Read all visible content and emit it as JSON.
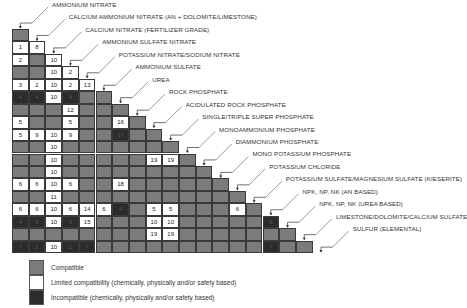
{
  "chart_data": {
    "type": "heatmap",
    "items": [
      "AMMONIUM NITRATE",
      "CALCIUM AMMONIUM NITRATE (AN + DOLOMITE/LIMESTONE)",
      "CALCIUM NITRATE (FERTILIZER GRADE)",
      "AMMONIUM SULFATE NITRATE",
      "POTASSIUM NITRATE/SODIUM NITRATE",
      "AMMONIUM SULFATE",
      "UREA",
      "ROCK PHOSPHATE",
      "ACIDULATED ROCK PHOSPHATE",
      "SINGLE/TRIPLE SUPER PHOSPHATE",
      "MONOAMMONIUM PHOSPHATE",
      "DIAMMONIUM PHOSPHATE",
      "MONO POTASSIUM PHOSPHATE",
      "POTASSIUM CHLORIDE",
      "POTASSIUM SULFATE/MAGNESIUM SULFATE (KIESERITE)",
      "NPK, NP, NK (AN BASED)",
      "NPK, NP, NK (UREA BASED)",
      "LIMESTONE/DOLOMITE/CALCIUM SULFATE",
      "SULFUR (ELEMENTAL)"
    ],
    "codes": {
      "g": "Compatible",
      "w": "Limited compatibility",
      "d": "Incompatible"
    },
    "rows": [
      [
        [
          "g",
          ""
        ]
      ],
      [
        [
          "w",
          "1"
        ],
        [
          "w",
          "8"
        ]
      ],
      [
        [
          "w",
          "2"
        ],
        [
          "g",
          ""
        ],
        [
          "w",
          "10"
        ]
      ],
      [
        [
          "g",
          ""
        ],
        [
          "g",
          ""
        ],
        [
          "w",
          "10"
        ],
        [
          "w",
          "2"
        ]
      ],
      [
        [
          "w",
          "3"
        ],
        [
          "w",
          "2"
        ],
        [
          "w",
          "10"
        ],
        [
          "w",
          "2"
        ],
        [
          "w",
          "13"
        ]
      ],
      [
        [
          "d",
          "4"
        ],
        [
          "d",
          "4"
        ],
        [
          "w",
          "10"
        ],
        [
          "d",
          "4"
        ],
        [
          "g",
          ""
        ],
        [
          "g",
          ""
        ]
      ],
      [
        [
          "g",
          ""
        ],
        [
          "g",
          ""
        ],
        [
          "g",
          ""
        ],
        [
          "w",
          "12"
        ],
        [
          "g",
          ""
        ],
        [
          "g",
          ""
        ],
        [
          "g",
          ""
        ]
      ],
      [
        [
          "w",
          "5"
        ],
        [
          "g",
          ""
        ],
        [
          "g",
          ""
        ],
        [
          "w",
          "5"
        ],
        [
          "g",
          ""
        ],
        [
          "g",
          ""
        ],
        [
          "w",
          "16"
        ],
        [
          "g",
          ""
        ]
      ],
      [
        [
          "w",
          "5"
        ],
        [
          "w",
          "9"
        ],
        [
          "w",
          "10"
        ],
        [
          "w",
          "9"
        ],
        [
          "g",
          ""
        ],
        [
          "g",
          ""
        ],
        [
          "d",
          "17"
        ],
        [
          "g",
          ""
        ],
        [
          "g",
          ""
        ]
      ],
      [
        [
          "g",
          ""
        ],
        [
          "g",
          ""
        ],
        [
          "w",
          "10"
        ],
        [
          "g",
          ""
        ],
        [
          "g",
          ""
        ],
        [
          "g",
          ""
        ],
        [
          "g",
          ""
        ],
        [
          "g",
          ""
        ],
        [
          "g",
          ""
        ],
        [
          "g",
          ""
        ]
      ],
      [
        [
          "g",
          ""
        ],
        [
          "g",
          ""
        ],
        [
          "w",
          "10"
        ],
        [
          "g",
          ""
        ],
        [
          "g",
          ""
        ],
        [
          "g",
          ""
        ],
        [
          "g",
          ""
        ],
        [
          "g",
          ""
        ],
        [
          "w",
          "19"
        ],
        [
          "w",
          "19"
        ],
        [
          "g",
          ""
        ]
      ],
      [
        [
          "g",
          ""
        ],
        [
          "g",
          ""
        ],
        [
          "w",
          "10"
        ],
        [
          "g",
          ""
        ],
        [
          "g",
          ""
        ],
        [
          "g",
          ""
        ],
        [
          "g",
          ""
        ],
        [
          "g",
          ""
        ],
        [
          "g",
          ""
        ],
        [
          "g",
          ""
        ],
        [
          "g",
          ""
        ],
        [
          "g",
          ""
        ]
      ],
      [
        [
          "w",
          "6"
        ],
        [
          "w",
          "6"
        ],
        [
          "w",
          "10"
        ],
        [
          "w",
          "6"
        ],
        [
          "g",
          ""
        ],
        [
          "g",
          ""
        ],
        [
          "w",
          "18"
        ],
        [
          "g",
          ""
        ],
        [
          "g",
          ""
        ],
        [
          "g",
          ""
        ],
        [
          "g",
          ""
        ],
        [
          "g",
          ""
        ],
        [
          "g",
          ""
        ]
      ],
      [
        [
          "g",
          ""
        ],
        [
          "g",
          ""
        ],
        [
          "w",
          "11"
        ],
        [
          "g",
          ""
        ],
        [
          "g",
          ""
        ],
        [
          "g",
          ""
        ],
        [
          "g",
          ""
        ],
        [
          "g",
          ""
        ],
        [
          "g",
          ""
        ],
        [
          "g",
          ""
        ],
        [
          "g",
          ""
        ],
        [
          "g",
          ""
        ],
        [
          "g",
          ""
        ],
        [
          "g",
          ""
        ]
      ],
      [
        [
          "w",
          "6"
        ],
        [
          "w",
          "6"
        ],
        [
          "w",
          "10"
        ],
        [
          "w",
          "6"
        ],
        [
          "w",
          "14"
        ],
        [
          "w",
          "6"
        ],
        [
          "d",
          "4"
        ],
        [
          "g",
          ""
        ],
        [
          "w",
          "5"
        ],
        [
          "w",
          "5"
        ],
        [
          "g",
          ""
        ],
        [
          "g",
          ""
        ],
        [
          "g",
          ""
        ],
        [
          "w",
          "6"
        ],
        [
          "g",
          ""
        ]
      ],
      [
        [
          "d",
          "4"
        ],
        [
          "d",
          "6"
        ],
        [
          "w",
          "10"
        ],
        [
          "d",
          "6"
        ],
        [
          "w",
          "15"
        ],
        [
          "g",
          ""
        ],
        [
          "g",
          ""
        ],
        [
          "g",
          ""
        ],
        [
          "w",
          "10"
        ],
        [
          "w",
          "10"
        ],
        [
          "g",
          ""
        ],
        [
          "g",
          ""
        ],
        [
          "g",
          ""
        ],
        [
          "g",
          ""
        ],
        [
          "g",
          ""
        ],
        [
          "d",
          "6"
        ]
      ],
      [
        [
          "g",
          ""
        ],
        [
          "g",
          ""
        ],
        [
          "g",
          ""
        ],
        [
          "g",
          ""
        ],
        [
          "g",
          ""
        ],
        [
          "g",
          ""
        ],
        [
          "g",
          ""
        ],
        [
          "g",
          ""
        ],
        [
          "w",
          "19"
        ],
        [
          "w",
          "19"
        ],
        [
          "g",
          ""
        ],
        [
          "g",
          ""
        ],
        [
          "g",
          ""
        ],
        [
          "g",
          ""
        ],
        [
          "g",
          ""
        ],
        [
          "g",
          ""
        ],
        [
          "g",
          ""
        ]
      ],
      [
        [
          "d",
          "7"
        ],
        [
          "d",
          "1"
        ],
        [
          "w",
          "10"
        ],
        [
          "d",
          "1"
        ],
        [
          "d",
          "7"
        ],
        [
          "g",
          ""
        ],
        [
          "g",
          ""
        ],
        [
          "g",
          ""
        ],
        [
          "g",
          ""
        ],
        [
          "g",
          ""
        ],
        [
          "g",
          ""
        ],
        [
          "g",
          ""
        ],
        [
          "g",
          ""
        ],
        [
          "g",
          ""
        ],
        [
          "g",
          ""
        ],
        [
          "d",
          "7"
        ],
        [
          "g",
          ""
        ],
        [
          "g",
          ""
        ]
      ]
    ]
  },
  "colors": {
    "compatible": "#7b7b7b",
    "limited": "#ffffff",
    "incompatible": "#2c2c2c"
  },
  "legend": [
    {
      "key": "g",
      "label": "Compatible"
    },
    {
      "key": "w",
      "label": "Limited compatibility (chemically, physically and/or safety based)"
    },
    {
      "key": "d",
      "label": "Incompatible (chemically, physically and/or safety based)"
    }
  ]
}
